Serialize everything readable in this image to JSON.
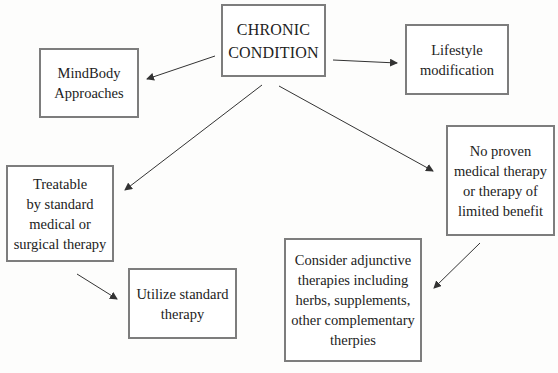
{
  "diagram": {
    "type": "flowchart",
    "colors": {
      "box_border": "#7d7d7d",
      "arrow": "#333333",
      "text": "#222222",
      "background": "#ffffff"
    },
    "nodes": {
      "chronic": {
        "lines": [
          "CHRONIC",
          "CONDITION"
        ]
      },
      "mindbody": {
        "lines": [
          "MindBody",
          "Approaches"
        ]
      },
      "lifestyle": {
        "lines": [
          "Lifestyle",
          "modification"
        ]
      },
      "treatable": {
        "lines": [
          "Treatable",
          "by standard",
          "medical or",
          "surgical therapy"
        ]
      },
      "noproven": {
        "lines": [
          "No proven",
          "medical therapy",
          "or therapy of",
          "limited benefit"
        ]
      },
      "consider": {
        "lines": [
          "Consider adjunctive",
          "therapies including",
          "herbs, supplements,",
          "other complementary",
          "therpies"
        ]
      },
      "utilize": {
        "lines": [
          "Utilize standard",
          "therapy"
        ]
      }
    },
    "edges": [
      {
        "from": "chronic",
        "to": "mindbody"
      },
      {
        "from": "chronic",
        "to": "lifestyle"
      },
      {
        "from": "chronic",
        "to": "treatable"
      },
      {
        "from": "chronic",
        "to": "noproven"
      },
      {
        "from": "treatable",
        "to": "utilize"
      },
      {
        "from": "noproven",
        "to": "consider"
      }
    ]
  }
}
